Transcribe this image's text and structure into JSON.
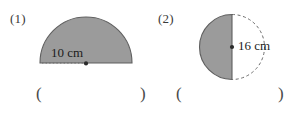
{
  "page": {
    "background_color": "#ffffff",
    "shape_fill_color": "#9b9b9b",
    "shape_stroke_color": "#5f5f5f",
    "text_color": "#231f20"
  },
  "problems": [
    {
      "number_label": "(1)",
      "figure": {
        "name": "semicircle-flat-bottom",
        "orientation": "up",
        "dashed_guide": "none",
        "dotted_radius": true,
        "center_dot": true
      },
      "dimension": {
        "value": "10",
        "unit": "cm",
        "text": "10 cm",
        "measure": "radius"
      },
      "answer": {
        "open_paren": "(",
        "close_paren": ")",
        "value": ""
      }
    },
    {
      "number_label": "(2)",
      "figure": {
        "name": "semicircle-flat-right",
        "orientation": "left",
        "dashed_guide": "right-arc",
        "dotted_radius": false,
        "center_dot": true
      },
      "dimension": {
        "value": "16",
        "unit": "cm",
        "text": "16 cm",
        "measure": "diameter"
      },
      "answer": {
        "open_paren": "(",
        "close_paren": ")",
        "value": ""
      }
    }
  ]
}
